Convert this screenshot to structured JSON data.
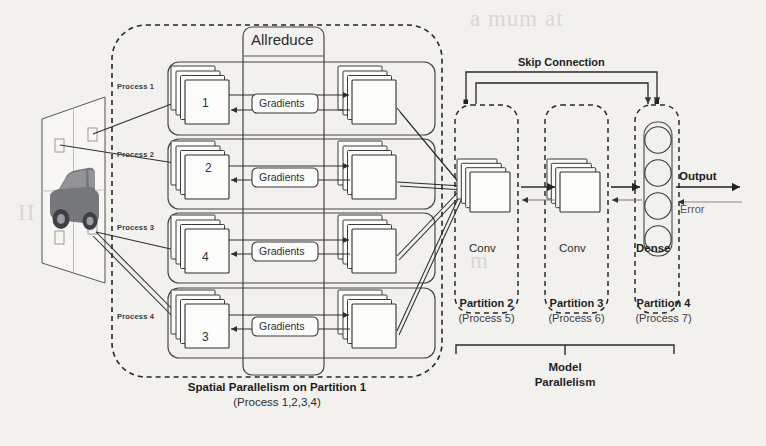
{
  "figure": {
    "background_color": "#f2f1ee",
    "ink_color": "#303030"
  },
  "input_image": {
    "name": "input-image-plane",
    "subject": "car",
    "tiles": 4
  },
  "spatial": {
    "group_label_line1": "Spatial Parallelism on Partition 1",
    "group_label_line2": "(Process 1,2,3,4)",
    "allreduce_label": "Allreduce",
    "gradients_label": "Gradients",
    "processes": [
      {
        "label": "Process 1",
        "tile_number": "1"
      },
      {
        "label": "Process 2",
        "tile_number": "2"
      },
      {
        "label": "Process 3",
        "tile_number": "4"
      },
      {
        "label": "Process 4",
        "tile_number": "3"
      }
    ]
  },
  "model": {
    "skip_connection_label": "Skip Connection",
    "bracket_label_line1": "Model",
    "bracket_label_line2": "Parallelism",
    "output_label": "Output",
    "error_label": "Error",
    "partitions": [
      {
        "type_label": "Conv",
        "name": "Partition 2",
        "process": "(Process 5)"
      },
      {
        "type_label": "Conv",
        "name": "Partition 3",
        "process": "(Process 6)"
      },
      {
        "type_label": "Dense",
        "name": "Partition 4",
        "process": "(Process 7)",
        "neurons": 4
      }
    ]
  },
  "bleed_text": {
    "top_right": "a mum at",
    "mid_left": "II",
    "mid_right": "m"
  }
}
